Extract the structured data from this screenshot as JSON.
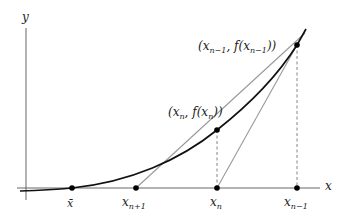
{
  "diagram": {
    "axes": {
      "x_label": "x",
      "y_label": "y"
    },
    "points": {
      "root": {
        "label": "x̄"
      },
      "x_n_plus_1": {
        "label_main": "x",
        "label_sub": "n+1"
      },
      "x_n": {
        "label_main": "x",
        "label_sub": "n"
      },
      "x_n_minus_1": {
        "label_main": "x",
        "label_sub": "n−1"
      }
    },
    "curve_labels": {
      "p_n": {
        "open": "(x",
        "sub1": "n",
        "mid": ", f(x",
        "sub2": "n",
        "close": "))"
      },
      "p_n_minus_1": {
        "open": "(x",
        "sub1": "n−1",
        "mid": ", f(x",
        "sub2": "n−1",
        "close": "))"
      }
    },
    "colors": {
      "curve": "#111111",
      "axis": "#555555",
      "secant": "#999999",
      "dashed": "#666666",
      "point": "#000000"
    }
  }
}
